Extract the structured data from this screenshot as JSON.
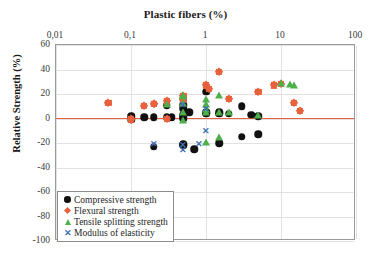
{
  "chart_data": {
    "type": "scatter",
    "title": "Plastic fibers (%)",
    "xlabel": "Plastic fibers (%)",
    "ylabel": "Relative Strength (%)",
    "xscale": "log",
    "xlim": [
      0.01,
      100
    ],
    "ylim": [
      -100,
      60
    ],
    "x_tick_labels": [
      "0,01",
      "0,1",
      "1",
      "10",
      "100"
    ],
    "x_tick_values": [
      0.01,
      0.1,
      1,
      10,
      100
    ],
    "y_tick_labels": [
      "60",
      "40",
      "20",
      "0",
      "-20",
      "-40",
      "-60",
      "-80",
      "-100"
    ],
    "y_tick_values": [
      60,
      40,
      20,
      0,
      -20,
      -40,
      -60,
      -80,
      -100
    ],
    "grid": true,
    "legend_position": "lower left",
    "zero_reference_line": 0,
    "zero_line_color": "#E8603C",
    "series": [
      {
        "name": "Compressive strength",
        "marker": "circle",
        "color": "#111111",
        "points": [
          [
            0.1,
            2
          ],
          [
            0.1,
            -1
          ],
          [
            0.15,
            1
          ],
          [
            0.2,
            1
          ],
          [
            0.3,
            11
          ],
          [
            0.3,
            1
          ],
          [
            0.35,
            1
          ],
          [
            0.5,
            8
          ],
          [
            0.5,
            2
          ],
          [
            0.5,
            0
          ],
          [
            0.5,
            11
          ],
          [
            0.5,
            3
          ],
          [
            0.6,
            5
          ],
          [
            1.0,
            22
          ],
          [
            1.0,
            5
          ],
          [
            1.0,
            4
          ],
          [
            1.5,
            4
          ],
          [
            1.5,
            5
          ],
          [
            2.0,
            4
          ],
          [
            3.0,
            10
          ],
          [
            4.0,
            3
          ],
          [
            5.0,
            2
          ],
          [
            3.0,
            -15
          ],
          [
            0.2,
            -23
          ],
          [
            0.5,
            -22
          ],
          [
            0.5,
            -21
          ],
          [
            0.7,
            -25
          ],
          [
            1.5,
            -20
          ],
          [
            5.0,
            -13
          ]
        ]
      },
      {
        "name": "Flexural strength",
        "marker": "diamond",
        "color": "#E8603C",
        "points": [
          [
            0.05,
            13
          ],
          [
            0.1,
            -1
          ],
          [
            0.1,
            0
          ],
          [
            0.15,
            10
          ],
          [
            0.2,
            12
          ],
          [
            0.2,
            12
          ],
          [
            0.3,
            14
          ],
          [
            0.3,
            0
          ],
          [
            0.5,
            16
          ],
          [
            0.5,
            18
          ],
          [
            0.5,
            15
          ],
          [
            1.0,
            27
          ],
          [
            1.1,
            24
          ],
          [
            1.5,
            38
          ],
          [
            2.0,
            16
          ],
          [
            5.0,
            22
          ],
          [
            8.0,
            27
          ],
          [
            10.0,
            28
          ],
          [
            15.0,
            13
          ],
          [
            18.0,
            6
          ]
        ]
      },
      {
        "name": "Tensile splitting strength",
        "marker": "triangle",
        "color": "#4FAF4B",
        "points": [
          [
            0.3,
            12
          ],
          [
            0.5,
            19
          ],
          [
            0.5,
            18
          ],
          [
            0.5,
            13
          ],
          [
            0.5,
            5
          ],
          [
            0.5,
            -1
          ],
          [
            1.0,
            16
          ],
          [
            1.0,
            12
          ],
          [
            1.0,
            8
          ],
          [
            1.0,
            5
          ],
          [
            1.5,
            19
          ],
          [
            1.5,
            5
          ],
          [
            2.0,
            5
          ],
          [
            5.0,
            3
          ],
          [
            10.0,
            29
          ],
          [
            13.0,
            28
          ],
          [
            15.0,
            27
          ],
          [
            1.5,
            -15
          ],
          [
            1.0,
            -19
          ]
        ]
      },
      {
        "name": "Modulus of elasticity",
        "marker": "cross",
        "color": "#3F6FB5",
        "points": [
          [
            0.5,
            11
          ],
          [
            1.0,
            8
          ],
          [
            1.0,
            -10
          ],
          [
            0.2,
            -21
          ],
          [
            0.5,
            -22
          ],
          [
            0.5,
            -26
          ],
          [
            0.8,
            -21
          ]
        ]
      }
    ]
  },
  "legend": {
    "items": [
      {
        "label": "Compressive strength",
        "marker": "circle-marker"
      },
      {
        "label": "Flexural strength",
        "marker": "diamond-marker"
      },
      {
        "label": "Tensile splitting strength",
        "marker": "triangle-marker"
      },
      {
        "label": "Modulus of elasticity",
        "marker": "cross-marker"
      }
    ]
  }
}
